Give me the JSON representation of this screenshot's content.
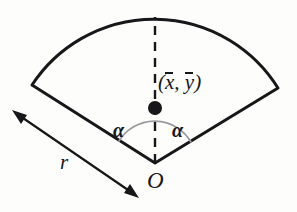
{
  "figure": {
    "background_color": "#fdfdfc",
    "ink_color": "#17171a",
    "arc_guide_color": "#9a9a9e",
    "labels": {
      "centroid_open_paren": "(",
      "centroid_x": "x",
      "centroid_comma": ", ",
      "centroid_y": "y",
      "centroid_close_paren": ")",
      "centroid_full": "(x̄, ȳ)",
      "alpha_left": "α",
      "alpha_right": "α",
      "origin": "O",
      "radius": "r"
    },
    "top_crop_text": "",
    "geometry": {
      "apex_x": 155,
      "apex_y": 163,
      "radius_px": 146,
      "half_angle_deg": 57,
      "arc_peak_x": 155,
      "arc_peak_y": 17,
      "left_corner_x": 32,
      "left_corner_y": 85,
      "right_corner_x": 278,
      "right_corner_y": 88,
      "centroid_dot_x": 155,
      "centroid_dot_y": 108,
      "centroid_dot_radius": 7,
      "angle_arc_radius": 42,
      "dimension_arrow_start_x": 14,
      "dimension_arrow_start_y": 112,
      "dimension_arrow_end_x": 137,
      "dimension_arrow_end_y": 196,
      "outline_stroke_width": 3,
      "dashed_stroke_width": 2.4,
      "dash_pattern": "9 7"
    }
  }
}
